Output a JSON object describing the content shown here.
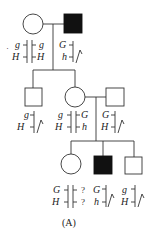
{
  "diagram": {
    "type": "pedigree",
    "caption": "(A)",
    "generations": [
      {
        "id": "I",
        "individuals": [
          {
            "id": "I-1",
            "sex": "female",
            "affected": false,
            "chromosomes": [
              {
                "top": "g",
                "bottom": "H"
              },
              {
                "top": "g",
                "bottom": "H"
              }
            ],
            "dot": "·"
          },
          {
            "id": "I-2",
            "sex": "male",
            "affected": true,
            "chromosomes": [
              {
                "top": "G",
                "bottom": "h"
              }
            ],
            "y_chromosome": true
          }
        ]
      },
      {
        "id": "II",
        "individuals": [
          {
            "id": "II-1",
            "sex": "male",
            "affected": false,
            "chromosomes": [
              {
                "top": "g",
                "bottom": "H"
              }
            ],
            "y_chromosome": true
          },
          {
            "id": "II-2",
            "sex": "female",
            "affected": false,
            "chromosomes": [
              {
                "top": "g",
                "bottom": "H"
              },
              {
                "top": "G",
                "bottom": "h"
              }
            ]
          },
          {
            "id": "II-3",
            "sex": "male",
            "affected": false,
            "chromosomes": [
              {
                "top": "G",
                "bottom": "H"
              }
            ],
            "y_chromosome": true
          }
        ]
      },
      {
        "id": "III",
        "individuals": [
          {
            "id": "III-1",
            "sex": "female",
            "affected": false,
            "chromosomes": [
              {
                "top": "G",
                "bottom": "H"
              },
              {
                "top": "?",
                "bottom": "?"
              }
            ]
          },
          {
            "id": "III-2",
            "sex": "male",
            "affected": true,
            "chromosomes": [
              {
                "top": "G",
                "bottom": "h"
              }
            ],
            "y_chromosome": true
          },
          {
            "id": "III-3",
            "sex": "male",
            "affected": false,
            "chromosomes": [
              {
                "top": "g",
                "bottom": "H"
              }
            ],
            "y_chromosome": true
          }
        ]
      }
    ]
  },
  "labels": {
    "i1_dot": "·",
    "i1_a_top": "g",
    "i1_a_bot": "H",
    "i1_b_top": "g",
    "i1_b_bot": "H",
    "i2_top": "G",
    "i2_bot": "h",
    "ii1_top": "g",
    "ii1_bot": "H",
    "ii2_a_top": "g",
    "ii2_a_bot": "H",
    "ii2_b_top": "G",
    "ii2_b_bot": "h",
    "ii3_top": "G",
    "ii3_bot": "H",
    "iii1_a_top": "G",
    "iii1_a_bot": "H",
    "iii1_b_top": "?",
    "iii1_b_bot": "?",
    "iii2_top": "G",
    "iii2_bot": "h",
    "iii3_top": "g",
    "iii3_bot": "H",
    "caption": "(A)"
  },
  "colors": {
    "line": "#333333",
    "affected_fill": "#111111",
    "unaffected_fill": "#ffffff"
  }
}
